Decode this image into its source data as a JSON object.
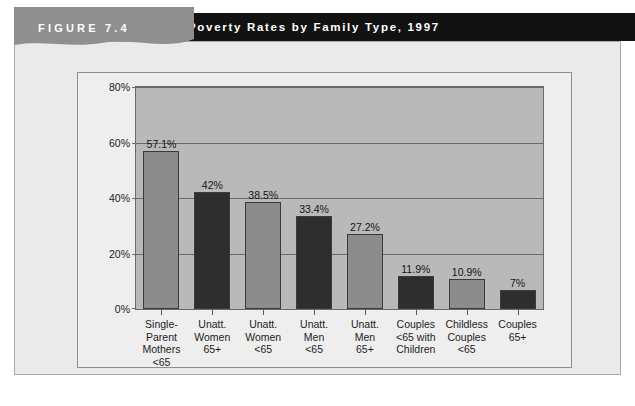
{
  "figure": {
    "tab_label": "FIGURE 7.4",
    "title": "Poverty Rates by Family Type, 1997"
  },
  "colors": {
    "title_bar": "#121212",
    "tab": "#8f8f8f",
    "panel_background": "#eaeaea",
    "plot_background": "#b9b9b9",
    "bar_light": "#8c8c8c",
    "bar_dark": "#2e2e2e",
    "gridline": "#6a6a6a"
  },
  "chart_data": {
    "type": "bar",
    "title": "Poverty Rates by Family Type, 1997",
    "xlabel": "",
    "ylabel": "",
    "ylim": [
      0,
      80
    ],
    "yticks": [
      "0%",
      "20%",
      "40%",
      "60%",
      "80%"
    ],
    "ytick_values": [
      0,
      20,
      40,
      60,
      80
    ],
    "grid": true,
    "legend": "none",
    "categories": [
      "Single-\nParent\nMothers\n<65",
      "Unatt.\nWomen\n65+",
      "Unatt.\nWomen\n<65",
      "Unatt.\nMen\n<65",
      "Unatt.\nMen\n65+",
      "Couples\n<65 with\nChildren",
      "Childless\nCouples\n<65",
      "Couples\n65+"
    ],
    "values": [
      57.1,
      42,
      38.5,
      33.4,
      27.2,
      11.9,
      10.9,
      7
    ],
    "data_labels": [
      "57.1%",
      "42%",
      "38.5%",
      "33.4%",
      "27.2%",
      "11.9%",
      "10.9%",
      "7%"
    ],
    "bar_shades": [
      "light",
      "dark",
      "light",
      "dark",
      "light",
      "dark",
      "light",
      "dark"
    ]
  }
}
